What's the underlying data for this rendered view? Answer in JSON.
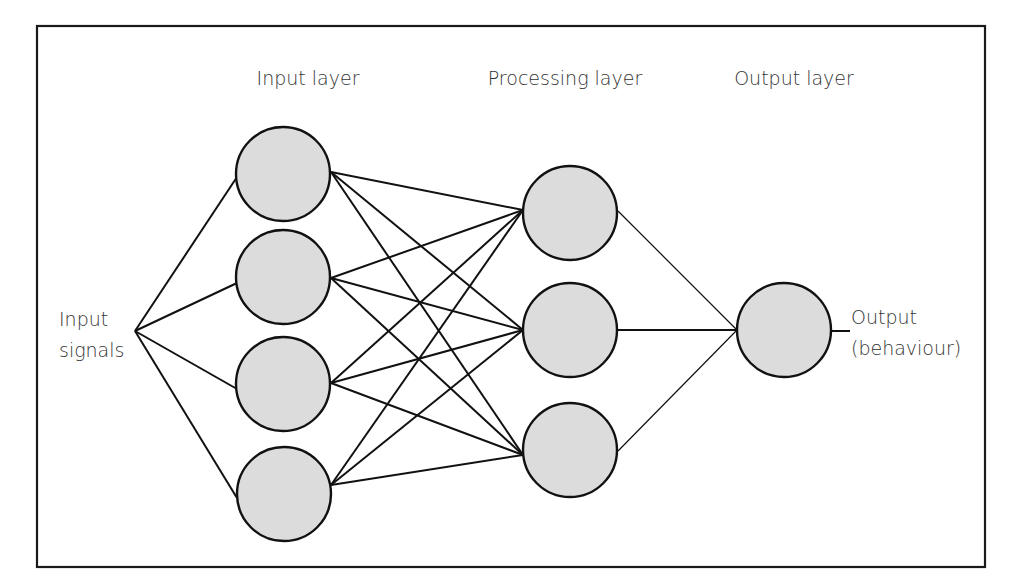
{
  "diagram": {
    "title_labels": {
      "input_layer": "Input layer",
      "processing_layer": "Processing layer",
      "output_layer": "Output layer"
    },
    "side_labels": {
      "input_signals_line1": "Input",
      "input_signals_line2": "signals",
      "output_line1": "Output",
      "output_line2": "(behaviour)"
    },
    "colors": {
      "node_fill": "#dcdcdc",
      "stroke": "#111111",
      "text": "#333333"
    },
    "layers": {
      "input": {
        "count": 4
      },
      "processing": {
        "count": 3
      },
      "output": {
        "count": 1
      }
    },
    "connections": "fully connected: input signals -> 4 input nodes -> 3 processing nodes -> 1 output node -> output"
  }
}
